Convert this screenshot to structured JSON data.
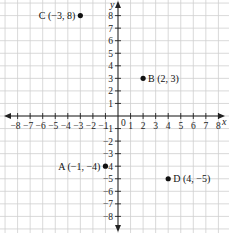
{
  "chart_data": {
    "type": "scatter",
    "title": "",
    "xlabel": "x",
    "ylabel": "y",
    "xlim": [
      -9,
      9
    ],
    "ylim": [
      -9,
      9
    ],
    "grid": true,
    "origin_label": "0",
    "x_ticks": [
      -8,
      -7,
      -6,
      -5,
      -4,
      -3,
      -2,
      -1,
      1,
      2,
      3,
      4,
      5,
      6,
      7,
      8
    ],
    "y_ticks": [
      -8,
      -7,
      -6,
      -5,
      -4,
      -3,
      -2,
      -1,
      1,
      2,
      3,
      4,
      5,
      6,
      7,
      8
    ],
    "points": [
      {
        "name": "A",
        "x": -1,
        "y": -4,
        "label": "A (−1, −4)",
        "label_side": "left"
      },
      {
        "name": "B",
        "x": 2,
        "y": 3,
        "label": "B (2, 3)",
        "label_side": "right"
      },
      {
        "name": "C",
        "x": -3,
        "y": 8,
        "label": "C (−3, 8)",
        "label_side": "left"
      },
      {
        "name": "D",
        "x": 4,
        "y": -5,
        "label": "D (4, −5)",
        "label_side": "right"
      }
    ]
  },
  "colors": {
    "grid": "#cfcfcf",
    "axis": "#222222",
    "point": "#111111"
  }
}
